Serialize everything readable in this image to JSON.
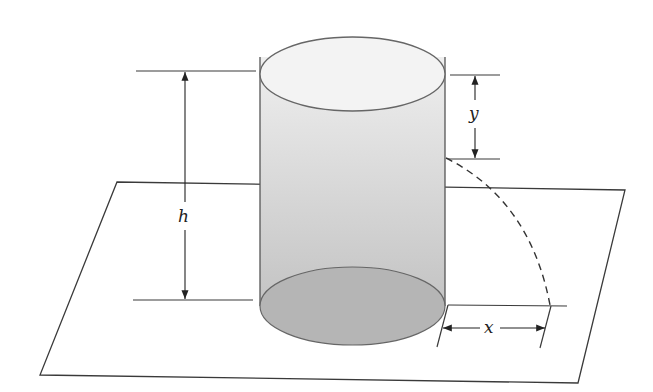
{
  "diagram": {
    "type": "geometry-figure",
    "colors": {
      "stroke": "#3a3a3a",
      "cylinder_top": "#f2f2f2",
      "cylinder_body_top": "#ececec",
      "cylinder_body_bottom": "#bcbcbc",
      "cylinder_base": "#b4b4b4",
      "background": "#ffffff"
    },
    "labels": {
      "height": "h",
      "drop": "y",
      "horizontal_distance": "x"
    },
    "elements": [
      {
        "name": "plane",
        "kind": "parallelogram"
      },
      {
        "name": "cylinder",
        "kind": "cylinder"
      },
      {
        "name": "height-dimension",
        "label": "h"
      },
      {
        "name": "drop-dimension",
        "label": "y"
      },
      {
        "name": "distance-dimension",
        "label": "x"
      },
      {
        "name": "trajectory",
        "kind": "dashed-curve"
      }
    ]
  }
}
